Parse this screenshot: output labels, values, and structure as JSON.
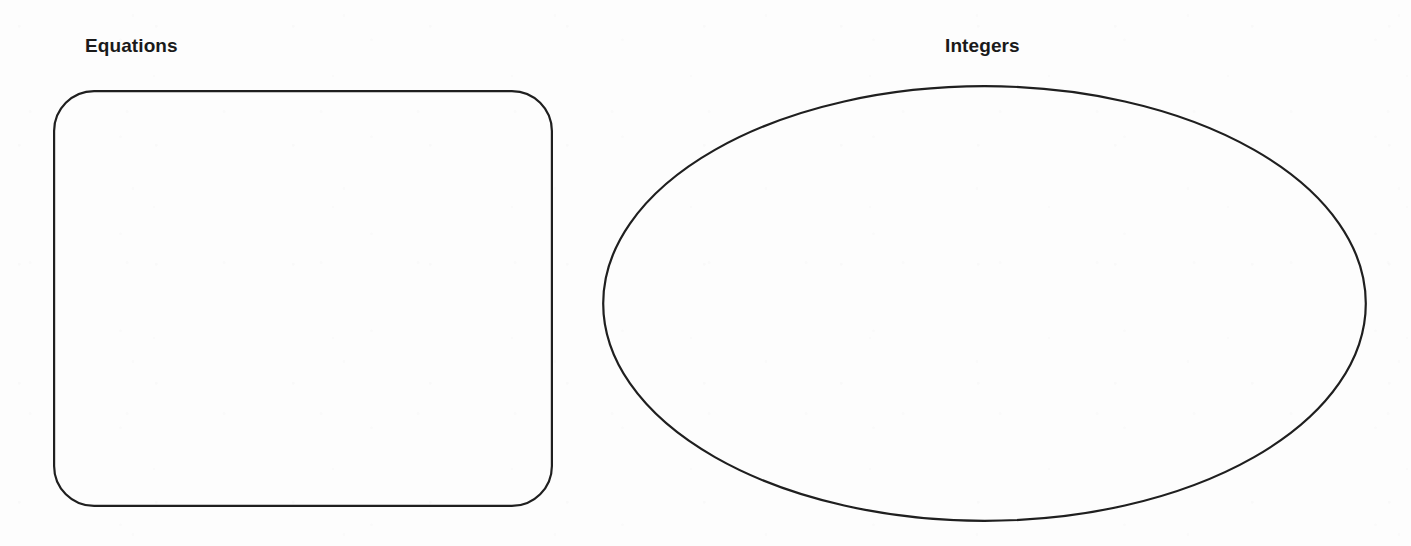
{
  "page": {
    "background_color": "#fdfdfd",
    "stroke_color": "#1f1f1f",
    "text_color": "#1a1a1a",
    "width": 1411,
    "height": 546
  },
  "categories": [
    {
      "id": "equations",
      "label": "Equations",
      "shape": "rounded-rectangle",
      "contents": [],
      "bounds": {
        "x": 53,
        "y": 90,
        "width": 500,
        "height": 417,
        "corner_radius": 40
      }
    },
    {
      "id": "integers",
      "label": "Integers",
      "shape": "ellipse",
      "contents": [],
      "bounds": {
        "x": 602,
        "y": 85,
        "width": 765,
        "height": 437
      }
    }
  ]
}
